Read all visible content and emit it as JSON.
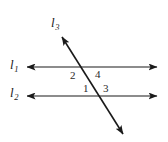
{
  "figure": {
    "width": 168,
    "height": 142,
    "background_color": "#ffffff",
    "stroke_color": "#1a1a1a",
    "lines": [
      {
        "name": "l1",
        "label": "l",
        "subscript": "1",
        "type": "horizontal-double-arrow",
        "x1": 27,
        "y1": 67,
        "x2": 157,
        "y2": 67
      },
      {
        "name": "l2",
        "label": "l",
        "subscript": "2",
        "type": "horizontal-double-arrow",
        "x1": 27,
        "y1": 96,
        "x2": 157,
        "y2": 96
      },
      {
        "name": "l3",
        "label": "l",
        "subscript": "3",
        "type": "diagonal-double-arrow",
        "x1": 62,
        "y1": 37,
        "x2": 123,
        "y2": 134
      }
    ],
    "angle_labels": [
      {
        "name": "angle-2",
        "text": "2",
        "x": 70,
        "y": 70
      },
      {
        "name": "angle-4",
        "text": "4",
        "x": 95,
        "y": 69
      },
      {
        "name": "angle-1",
        "text": "1",
        "x": 83,
        "y": 83
      },
      {
        "name": "angle-3",
        "text": "3",
        "x": 103,
        "y": 83
      }
    ]
  }
}
